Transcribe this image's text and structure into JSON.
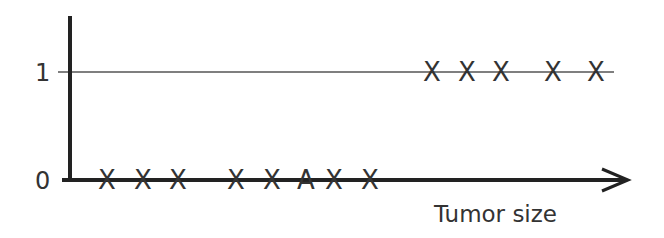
{
  "chart_data": {
    "type": "scatter",
    "title": "",
    "xlabel": "Tumor size",
    "ylabel": "",
    "y_ticks": [
      "0",
      "1"
    ],
    "ylim": [
      0,
      1
    ],
    "grid": false,
    "reference_line": {
      "y": 1
    },
    "series": [
      {
        "name": "Malignant = 0",
        "y": 0,
        "marker": "X",
        "x_pixels": [
          107,
          143,
          178,
          236,
          272,
          334,
          370
        ]
      },
      {
        "name": "Malignant = 0 (annotated)",
        "y": 0,
        "marker": "A",
        "x_pixels": [
          306
        ]
      },
      {
        "name": "Malignant = 1",
        "y": 1,
        "marker": "X",
        "x_pixels": [
          432,
          467,
          501,
          553,
          596
        ]
      }
    ]
  },
  "labels": {
    "y_tick_0": "0",
    "y_tick_1": "1",
    "x_axis": "Tumor size"
  },
  "colors": {
    "axis": "#222222",
    "reference_line": "#555555",
    "marker": "#333333"
  }
}
